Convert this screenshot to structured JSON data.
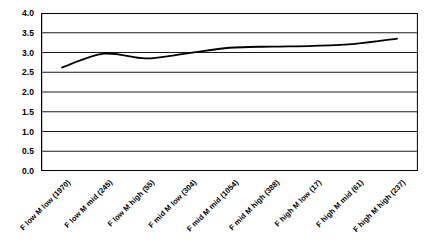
{
  "chart_data": {
    "type": "line",
    "title": "",
    "xlabel": "",
    "ylabel": "",
    "categories": [
      "F low M low (1970)",
      "F low M mid (245)",
      "F low M high (55)",
      "F mid M low (304)",
      "F mid M mid (1054)",
      "F mid M high (388)",
      "F high M low (17)",
      "F high M mid (61)",
      "F high M high (237)"
    ],
    "values": [
      2.62,
      2.97,
      2.85,
      2.98,
      3.12,
      3.15,
      3.17,
      3.22,
      3.35
    ],
    "ylim": [
      0.0,
      4.0
    ],
    "y_ticks": [
      "4.0",
      "3.5",
      "3.0",
      "2.5",
      "2.0",
      "1.5",
      "1.0",
      "0.5",
      "0.0"
    ],
    "y_tick_values": [
      4.0,
      3.5,
      3.0,
      2.5,
      2.0,
      1.5,
      1.0,
      0.5,
      0.0
    ],
    "grid": "horizontal",
    "legend": "none",
    "smoothing": "spline",
    "series": [
      {
        "name": "series-1",
        "color": "#000000",
        "line_width": 1.8,
        "values": [
          2.62,
          2.97,
          2.85,
          2.98,
          3.12,
          3.15,
          3.17,
          3.22,
          3.35
        ]
      }
    ]
  },
  "style": {
    "plot_background": "#ffffff",
    "grid_color": "#000000",
    "axis_color": "#000000",
    "text_color": "#000000"
  }
}
